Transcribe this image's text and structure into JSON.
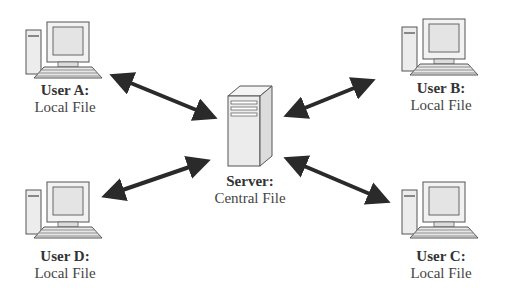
{
  "diagram": {
    "type": "client-server file sync",
    "server": {
      "title": "Server:",
      "subtitle": "Central File"
    },
    "users": [
      {
        "id": "A",
        "title": "User A:",
        "subtitle": "Local File"
      },
      {
        "id": "B",
        "title": "User B:",
        "subtitle": "Local File"
      },
      {
        "id": "C",
        "title": "User C:",
        "subtitle": "Local File"
      },
      {
        "id": "D",
        "title": "User D:",
        "subtitle": "Local File"
      }
    ],
    "connections": [
      {
        "from": "User A",
        "to": "Server",
        "direction": "bidirectional"
      },
      {
        "from": "User B",
        "to": "Server",
        "direction": "bidirectional"
      },
      {
        "from": "User C",
        "to": "Server",
        "direction": "bidirectional"
      },
      {
        "from": "User D",
        "to": "Server",
        "direction": "bidirectional"
      }
    ],
    "colors": {
      "arrow": "#2a2a2a",
      "icon_outline": "#555555",
      "icon_fill": "#ececec",
      "text": "#333333"
    }
  }
}
